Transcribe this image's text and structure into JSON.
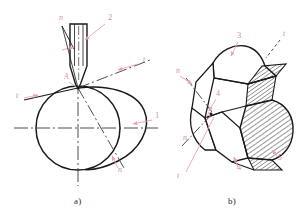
{
  "figure": {
    "background_color": "#ffffff",
    "outline_color": "#1a1a1a",
    "annotation_color": "#e8a0b8",
    "annotation_text_color": "#d98ca8",
    "caption_color": "#2b2b2b",
    "centerline_color": "#3a3a3a",
    "hatch_color": "#1a1a1a"
  },
  "captions": {
    "a": "a)",
    "b": "b)"
  },
  "panel_a": {
    "name": "two-dimensional-schematic",
    "labels": [
      {
        "id": "a-n-top",
        "text": "n",
        "x": 59,
        "y": 20
      },
      {
        "id": "a-part-2",
        "text": "2",
        "x": 108,
        "y": 20
      },
      {
        "id": "a-t-right",
        "text": "t",
        "x": 143,
        "y": 62
      },
      {
        "id": "a-A-point",
        "text": "A",
        "x": 64,
        "y": 79
      },
      {
        "id": "a-t-left",
        "text": "t",
        "x": 16,
        "y": 98
      },
      {
        "id": "a-part-1",
        "text": "1",
        "x": 155,
        "y": 118
      },
      {
        "id": "a-n-bottom",
        "text": "n",
        "x": 118,
        "y": 172
      }
    ],
    "geometry": {
      "workpiece_circle": {
        "cx": 78,
        "cy": 128,
        "r": 42
      },
      "tool_tip_point": {
        "x": 78,
        "y": 88
      },
      "tool_shank": {
        "x": 70,
        "y": 24,
        "w": 17,
        "h": 48
      },
      "vector_t_angle_deg": 22,
      "vector_n_angle_deg": 68
    }
  },
  "panel_b": {
    "name": "three-dimensional-tool-view",
    "labels": [
      {
        "id": "b-part-3",
        "text": "3",
        "x": 237,
        "y": 38
      },
      {
        "id": "b-t-top",
        "text": "t",
        "x": 283,
        "y": 36
      },
      {
        "id": "b-n-left",
        "text": "n",
        "x": 176,
        "y": 73
      },
      {
        "id": "b-part-4a",
        "text": "4",
        "x": 216,
        "y": 96
      },
      {
        "id": "b-A-point",
        "text": "A",
        "x": 206,
        "y": 118
      },
      {
        "id": "b-n-lower",
        "text": "n",
        "x": 183,
        "y": 140
      },
      {
        "id": "b-part-4b",
        "text": "4",
        "x": 237,
        "y": 170
      },
      {
        "id": "b-part-5",
        "text": "5",
        "x": 278,
        "y": 160
      },
      {
        "id": "b-t-lower",
        "text": "t",
        "x": 177,
        "y": 178
      }
    ]
  },
  "legend_items": [
    {
      "key": "1",
      "meaning": "workpiece surface curve"
    },
    {
      "key": "2",
      "meaning": "tool shank"
    },
    {
      "key": "3",
      "meaning": "rake face"
    },
    {
      "key": "4",
      "meaning": "flank face"
    },
    {
      "key": "5",
      "meaning": "cutting edge land"
    },
    {
      "key": "n",
      "meaning": "normal direction vector"
    },
    {
      "key": "t",
      "meaning": "tangential direction vector"
    },
    {
      "key": "A",
      "meaning": "cutting point"
    }
  ]
}
